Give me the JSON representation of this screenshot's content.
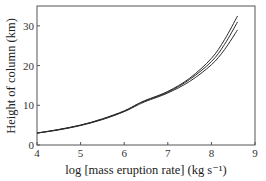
{
  "chart_data": {
    "type": "line",
    "title": "",
    "xlabel": "log [mass eruption rate] (kg s⁻¹)",
    "ylabel": "Height of column (km)",
    "xlim": [
      4,
      9
    ],
    "ylim": [
      0,
      35
    ],
    "xticks": [
      4,
      5,
      6,
      7,
      8,
      9
    ],
    "yticks": [
      0,
      10,
      20,
      30
    ],
    "grid": false,
    "legend": null,
    "series": [
      {
        "name": "curve-upper",
        "x": [
          4.0,
          4.5,
          5.0,
          5.5,
          6.0,
          6.3,
          6.5,
          7.0,
          7.5,
          8.0,
          8.3,
          8.6
        ],
        "y": [
          3.0,
          3.9,
          5.0,
          6.6,
          8.6,
          10.3,
          11.3,
          13.5,
          16.8,
          21.8,
          26.5,
          32.5
        ]
      },
      {
        "name": "curve-middle",
        "x": [
          4.0,
          4.5,
          5.0,
          5.5,
          6.0,
          6.3,
          6.5,
          7.0,
          7.5,
          8.0,
          8.3,
          8.6
        ],
        "y": [
          3.0,
          3.9,
          5.0,
          6.5,
          8.5,
          10.2,
          11.2,
          13.3,
          16.5,
          21.0,
          25.3,
          31.0
        ]
      },
      {
        "name": "curve-lower",
        "x": [
          4.0,
          4.5,
          5.0,
          5.5,
          6.0,
          6.3,
          6.5,
          7.0,
          7.5,
          8.0,
          8.3,
          8.6
        ],
        "y": [
          3.0,
          3.8,
          4.9,
          6.4,
          8.4,
          10.0,
          11.0,
          13.1,
          16.0,
          20.2,
          24.0,
          29.0
        ]
      }
    ]
  },
  "axes": {
    "x_label": "log [mass eruption rate] (kg s⁻¹)",
    "y_label": "Height of column (km)"
  },
  "colors": {
    "line": "#2a2a2a",
    "frame": "#555555"
  }
}
